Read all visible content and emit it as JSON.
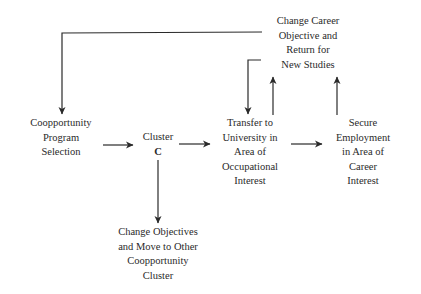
{
  "diagram": {
    "nodes": {
      "change_career": {
        "lines": [
          "Change Career",
          "Objective and",
          "Return for",
          "New Studies"
        ]
      },
      "coopportunity_program": {
        "lines": [
          "Coopportunity",
          "Program",
          "Selection"
        ]
      },
      "cluster_c": {
        "lines": [
          "Cluster",
          "C"
        ]
      },
      "transfer_university": {
        "lines": [
          "Transfer to",
          "University in",
          "Area of",
          "Occupational",
          "Interest"
        ]
      },
      "secure_employment": {
        "lines": [
          "Secure",
          "Employment",
          "in Area of",
          "Career",
          "Interest"
        ]
      },
      "change_objectives": {
        "lines": [
          "Change Objectives",
          "and Move to Other",
          "Coopportunity",
          "Cluster"
        ]
      }
    },
    "edges": [
      {
        "from": "coopportunity_program",
        "to": "cluster_c"
      },
      {
        "from": "cluster_c",
        "to": "transfer_university"
      },
      {
        "from": "transfer_university",
        "to": "secure_employment"
      },
      {
        "from": "cluster_c",
        "to": "change_objectives"
      },
      {
        "from": "transfer_university",
        "to": "change_career"
      },
      {
        "from": "secure_employment",
        "to": "change_career"
      },
      {
        "from": "change_career",
        "to": "coopportunity_program"
      },
      {
        "from": "change_career",
        "to": "transfer_university"
      }
    ],
    "colors": {
      "line": "#2a2a2a",
      "background": "#ffffff"
    }
  }
}
